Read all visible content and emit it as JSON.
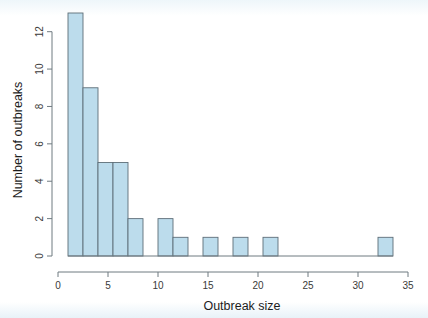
{
  "chart_data": {
    "type": "bar",
    "title": "",
    "subtitle": "",
    "xlabel": "Outbreak size",
    "ylabel": "Number of outbreaks",
    "xlim": [
      0,
      35
    ],
    "ylim": [
      0,
      13
    ],
    "xticks": [
      0,
      5,
      10,
      15,
      20,
      25,
      30,
      35
    ],
    "xticklabels": [
      "0",
      "5",
      "10",
      "15",
      "20",
      "25",
      "30",
      "35"
    ],
    "yticks": [
      0,
      2,
      4,
      6,
      8,
      10,
      12
    ],
    "yticklabels": [
      "0",
      "2",
      "4",
      "6",
      "8",
      "10",
      "12"
    ],
    "grid": false,
    "legend": null,
    "bin_width": 1.5,
    "bar_fill": "#bcdcec",
    "bar_edge": "#5e6e78",
    "axis_color": "#6f7b80",
    "background": "#ffffff",
    "bins": [
      {
        "x0": 1.0,
        "x1": 2.5,
        "value": 13
      },
      {
        "x0": 2.5,
        "x1": 4.0,
        "value": 9
      },
      {
        "x0": 4.0,
        "x1": 5.5,
        "value": 5
      },
      {
        "x0": 5.5,
        "x1": 7.0,
        "value": 5
      },
      {
        "x0": 7.0,
        "x1": 8.5,
        "value": 2
      },
      {
        "x0": 8.5,
        "x1": 10.0,
        "value": 0
      },
      {
        "x0": 10.0,
        "x1": 11.5,
        "value": 2
      },
      {
        "x0": 11.5,
        "x1": 13.0,
        "value": 1
      },
      {
        "x0": 13.0,
        "x1": 14.5,
        "value": 0
      },
      {
        "x0": 14.5,
        "x1": 16.0,
        "value": 1
      },
      {
        "x0": 16.0,
        "x1": 17.5,
        "value": 0
      },
      {
        "x0": 17.5,
        "x1": 19.0,
        "value": 1
      },
      {
        "x0": 19.0,
        "x1": 20.5,
        "value": 0
      },
      {
        "x0": 20.5,
        "x1": 22.0,
        "value": 1
      },
      {
        "x0": 22.0,
        "x1": 23.5,
        "value": 0
      },
      {
        "x0": 23.5,
        "x1": 25.0,
        "value": 0
      },
      {
        "x0": 25.0,
        "x1": 26.5,
        "value": 0
      },
      {
        "x0": 26.5,
        "x1": 28.0,
        "value": 0
      },
      {
        "x0": 28.0,
        "x1": 29.5,
        "value": 0
      },
      {
        "x0": 29.5,
        "x1": 31.0,
        "value": 0
      },
      {
        "x0": 31.0,
        "x1": 32.5,
        "value": 0
      },
      {
        "x0": 32.5,
        "x1": 34.0,
        "value": 0
      },
      {
        "x0": 34.0,
        "x1": 35.5,
        "value": 0
      },
      {
        "x0": 36.0,
        "x1": 37.5,
        "value": 0
      },
      {
        "x0": 48.0,
        "x1": 49.5,
        "value": 0
      }
    ],
    "bars_drawn": [
      {
        "x0": 1.0,
        "x1": 2.5,
        "value": 13
      },
      {
        "x0": 2.5,
        "x1": 4.0,
        "value": 9
      },
      {
        "x0": 4.0,
        "x1": 5.5,
        "value": 5
      },
      {
        "x0": 5.5,
        "x1": 7.0,
        "value": 5
      },
      {
        "x0": 7.0,
        "x1": 8.5,
        "value": 2
      },
      {
        "x0": 10.0,
        "x1": 11.5,
        "value": 2
      },
      {
        "x0": 11.5,
        "x1": 13.0,
        "value": 1
      },
      {
        "x0": 14.5,
        "x1": 16.0,
        "value": 1
      },
      {
        "x0": 17.5,
        "x1": 19.0,
        "value": 1
      },
      {
        "x0": 20.5,
        "x1": 22.0,
        "value": 1
      },
      {
        "x0": 32.0,
        "x1": 33.5,
        "value": 1
      }
    ]
  }
}
